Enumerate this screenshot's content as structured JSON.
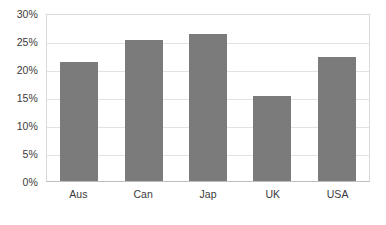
{
  "chart_data": {
    "type": "bar",
    "title": "",
    "subtitle": "",
    "xlabel": "",
    "ylabel": "",
    "categories": [
      "Aus",
      "Can",
      "Jap",
      "UK",
      "USA"
    ],
    "values": [
      21.3,
      25.2,
      26.2,
      15.1,
      22.1
    ],
    "value_labels": [
      "21.3%",
      "25.2%",
      "26.2%",
      "15.1%",
      "22.1%"
    ],
    "ylim": [
      0,
      30
    ],
    "ytick_step": 5,
    "ytick_labels": [
      "30%",
      "25%",
      "20%",
      "15%",
      "10%",
      "5%",
      "0%"
    ],
    "ytick_values": [
      30,
      25,
      20,
      15,
      10,
      5,
      0
    ],
    "grid": true,
    "legend": false,
    "legend_position": "none",
    "annotations": [],
    "colors": {
      "bar_fill": "#7b7b7b",
      "gridline": "#e2e2e2",
      "plot_border": "#d9d9d9",
      "axis_line": "#bdbdbd",
      "text": "#3a3a3a",
      "background": "#ffffff"
    }
  }
}
